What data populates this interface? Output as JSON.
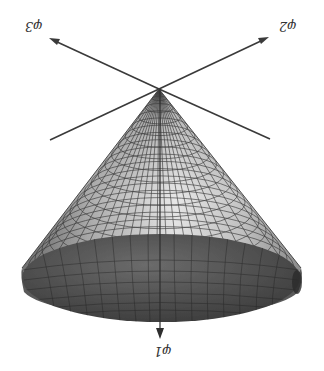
{
  "figure": {
    "labels": {
      "phi1": "φ1",
      "phi2": "φ2",
      "phi3": "φ3"
    },
    "colors": {
      "background": "#ffffff",
      "axis": "#3a3a3a",
      "mesh": "#2e2e2e",
      "cone_light": "#e6e6e6",
      "cone_mid": "#a8a8a8",
      "cone_dark": "#5a5a5a",
      "base_dark": "#4a4a4a",
      "base_mid": "#6e6e6e"
    },
    "geometry": {
      "apex": [
        159,
        89
      ],
      "base_center": [
        161,
        278
      ],
      "base_rx": 140,
      "base_ry": 44,
      "axis_phi3_tip": [
        49,
        38
      ],
      "axis_phi3_tail": [
        270,
        139
      ],
      "axis_phi2_tip": [
        269,
        37
      ],
      "axis_phi2_tail": [
        50,
        140
      ],
      "axis_phi1_tip": [
        160,
        338
      ]
    }
  }
}
